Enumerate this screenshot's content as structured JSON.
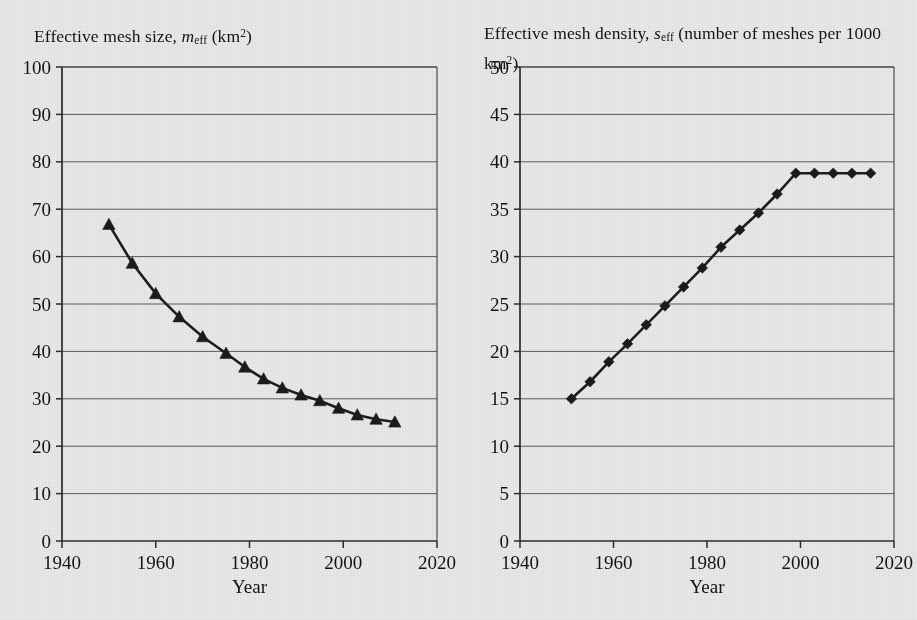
{
  "figure": {
    "background_color": "#e9e9e9",
    "ink_color": "#1a1a1a"
  },
  "left_panel": {
    "title_parts": {
      "lead": "Effective mesh size, ",
      "symbol": "m",
      "subscript": "eff",
      "trail_open": " (km",
      "superscript": "2",
      "trail_close": ")"
    },
    "xlabel": "Year"
  },
  "right_panel": {
    "title_parts": {
      "lead": "Effective mesh density, ",
      "symbol": "s",
      "subscript": "eff",
      "trail_open": " (number of meshes per 1000 km",
      "superscript": "2",
      "trail_close": ")"
    },
    "xlabel": "Year"
  },
  "chart_data": [
    {
      "id": "effective-mesh-size",
      "type": "line",
      "title": "Effective mesh size, m_eff (km2)",
      "xlabel": "Year",
      "ylabel": "",
      "marker": "triangle",
      "grid": true,
      "legend": "none",
      "xlim": [
        1940,
        2020
      ],
      "ylim": [
        0,
        100
      ],
      "xticks": [
        1940,
        1960,
        1980,
        2000,
        2020
      ],
      "yticks": [
        0,
        10,
        20,
        30,
        40,
        50,
        60,
        70,
        80,
        90,
        100
      ],
      "x": [
        1950,
        1955,
        1960,
        1965,
        1970,
        1975,
        1979,
        1983,
        1987,
        1991,
        1995,
        1999,
        2003,
        2007,
        2011
      ],
      "values": [
        66.8,
        58.6,
        52.2,
        47.3,
        43.1,
        39.6,
        36.7,
        34.2,
        32.3,
        30.8,
        29.6,
        28.0,
        26.6,
        25.7,
        25.1
      ]
    },
    {
      "id": "effective-mesh-density",
      "type": "line",
      "title": "Effective mesh density, s_eff (number of meshes per 1000 km2)",
      "xlabel": "Year",
      "ylabel": "",
      "marker": "diamond",
      "grid": true,
      "legend": "none",
      "xlim": [
        1940,
        2020
      ],
      "ylim": [
        0,
        50
      ],
      "xticks": [
        1940,
        1960,
        1980,
        2000,
        2020
      ],
      "yticks": [
        0,
        5,
        10,
        15,
        20,
        25,
        30,
        35,
        40,
        45,
        50
      ],
      "x": [
        1951,
        1955,
        1959,
        1963,
        1967,
        1971,
        1975,
        1979,
        1983,
        1987,
        1991,
        1995,
        1999,
        2003,
        2007,
        2011,
        2015
      ],
      "values": [
        15.0,
        16.8,
        18.9,
        20.8,
        22.8,
        24.8,
        26.8,
        28.8,
        31.0,
        32.8,
        34.6,
        36.6,
        38.8,
        38.8,
        38.8,
        38.8,
        38.8
      ]
    }
  ]
}
